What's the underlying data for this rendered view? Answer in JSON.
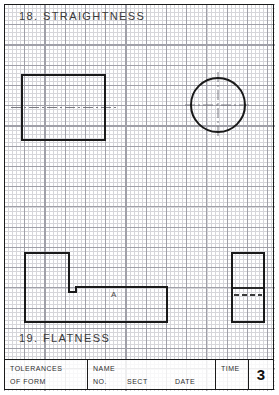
{
  "page": {
    "width": 279,
    "height": 395,
    "background_color": "#ffffff",
    "grid_fine_color": "#d6d6da",
    "grid_major_color": "#a0a0a8",
    "frame_color": "#1a1a1a"
  },
  "sections": {
    "straightness": {
      "heading": "18.  STRAIGHTNESS"
    },
    "flatness": {
      "heading": "19.  FLATNESS",
      "part_label": "A"
    }
  },
  "title_block": {
    "tolerances_line1": "TOLERANCES",
    "tolerances_line2": "OF  FORM",
    "name_label": "NAME",
    "no_label": "NO.",
    "sect_label": "SECT",
    "date_label": "DATE",
    "time_label": "TIME",
    "sheet_number": "3"
  },
  "drawing_data": {
    "type": "technical-drawing",
    "line_color": "#1a1a1a",
    "centerline_color": "#6e6e76",
    "shapes": [
      {
        "name": "straightness-rectangle",
        "kind": "rectangle",
        "x": 22,
        "y": 75,
        "width": 83,
        "height": 65,
        "centerline": "horizontal"
      },
      {
        "name": "straightness-circle",
        "kind": "circle",
        "cx": 218,
        "cy": 105,
        "r": 27,
        "centerline": "cross"
      },
      {
        "name": "flatness-l-part",
        "kind": "polygon",
        "points": "25,253 69,253 69,292 76,292 76,287 167,287 167,322 25,322",
        "label": "A"
      },
      {
        "name": "flatness-side-view",
        "kind": "rectangle",
        "x": 232,
        "y": 253,
        "width": 32,
        "height": 69,
        "solid_divider_y": 288,
        "dashed_divider_y": 295
      }
    ]
  }
}
